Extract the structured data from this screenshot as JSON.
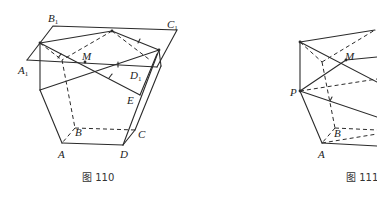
{
  "figures": [
    {
      "caption": "图 110",
      "labels": {
        "B1": "B",
        "B1_sub": "1",
        "C1": "C",
        "C1_sub": "1",
        "A1": "A",
        "A1_sub": "1",
        "M": "M",
        "D1": "D",
        "D1_sub": "1",
        "E": "E",
        "A": "A",
        "B": "B",
        "C": "C",
        "D": "D"
      }
    },
    {
      "caption": "图 111",
      "labels": {
        "M": "M",
        "P": "P",
        "A": "A",
        "B": "B"
      }
    }
  ],
  "colors": {
    "line": "#2b2b2b",
    "text": "#222222",
    "background": "#ffffff"
  }
}
